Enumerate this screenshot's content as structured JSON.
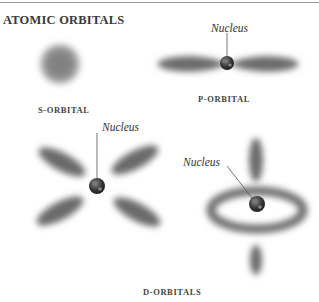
{
  "title": "ATOMIC ORBITALS",
  "panels": {
    "s": {
      "label": "S-ORBITAL"
    },
    "p": {
      "label": "P-ORBITAL",
      "pointer_label": "Nucleus"
    },
    "d": {
      "label": "D-ORBITALS",
      "pointer_labels": [
        "Nucleus",
        "Nucleus"
      ]
    }
  },
  "colors": {
    "lobe": "#6e6e6e",
    "nucleus": "#3c3c3c",
    "text": "#3a3a3a",
    "rule": "#9a9a9a"
  }
}
